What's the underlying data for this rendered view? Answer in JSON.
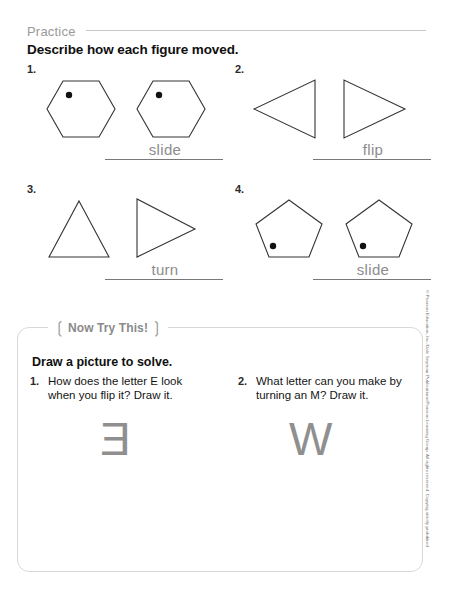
{
  "page": {
    "section_label": "Practice",
    "directions": "Describe how each figure moved.",
    "copyright": "© Pearson Education, Inc./Dale Seymour Publications/Pearson Learning Group. All rights reserved. Copying strictly prohibited."
  },
  "problems": [
    {
      "number": "1.",
      "left_figure": "hexagon with dot upper-left",
      "right_figure": "hexagon with dot upper-left",
      "answer": "slide"
    },
    {
      "number": "2.",
      "left_figure": "triangle pointing left",
      "right_figure": "triangle pointing right",
      "answer": "flip"
    },
    {
      "number": "3.",
      "left_figure": "triangle pointing up",
      "right_figure": "triangle pointing right",
      "answer": "turn"
    },
    {
      "number": "4.",
      "left_figure": "pentagon with dot lower-left",
      "right_figure": "pentagon with dot lower-left",
      "answer": "slide"
    }
  ],
  "try_this": {
    "title": "Now Try This!",
    "bracket_left": "❲",
    "bracket_right": "❳",
    "subtitle": "Draw a picture to solve.",
    "questions": [
      {
        "number": "1.",
        "text": "How does the letter E look when you flip it? Draw it.",
        "answer_glyph": "E"
      },
      {
        "number": "2.",
        "text": "What letter can you make by turning an M? Draw it.",
        "answer_glyph": "W"
      }
    ]
  }
}
